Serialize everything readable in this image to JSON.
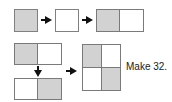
{
  "diagram": {
    "title": "Make 32.",
    "colors": {
      "fill_gray": "#d2d2d2",
      "fill_white": "#ffffff",
      "outline": "#7a7a7a",
      "arrow": "#111111",
      "background": "#ffffff",
      "text": "#1a1a1a"
    },
    "caption": {
      "text": "Make 32."
    },
    "row_top": {
      "label": "top-sequence",
      "shape_a": {
        "name": "gray-square",
        "fill": "gray"
      },
      "shape_b": {
        "name": "white-square",
        "fill": "white"
      },
      "shape_c": {
        "name": "gray-white-rectangle",
        "cells": [
          "gray",
          "white"
        ]
      },
      "arrow_1": {
        "name": "right-arrow",
        "direction": "right"
      },
      "arrow_2": {
        "name": "right-arrow",
        "direction": "right"
      }
    },
    "row_bottom": {
      "label": "bottom-sequence",
      "shape_a": {
        "name": "gray-white-rectangle",
        "cells": [
          "gray",
          "white"
        ]
      },
      "shape_b": {
        "name": "white-gray-rectangle",
        "cells": [
          "white",
          "gray"
        ]
      },
      "shape_c": {
        "name": "checkerboard-square",
        "cells": [
          "gray",
          "white",
          "white",
          "gray"
        ]
      },
      "arrow_down": {
        "name": "down-arrow",
        "direction": "down"
      },
      "arrow_right": {
        "name": "right-arrow",
        "direction": "right"
      }
    }
  }
}
